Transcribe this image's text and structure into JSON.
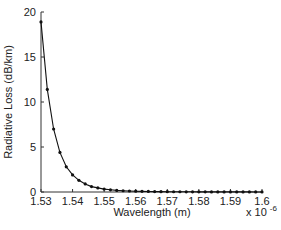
{
  "chart_data": {
    "type": "line",
    "title": "",
    "xlabel": "Wavelength (m)",
    "ylabel": "Radiative Loss (dB/km)",
    "x_multiplier": "x 10",
    "x_multiplier_exp": "-6",
    "xlim": [
      1.53,
      1.6
    ],
    "ylim": [
      0,
      20
    ],
    "xticks": [
      "1.53",
      "1.54",
      "1.55",
      "1.56",
      "1.57",
      "1.58",
      "1.59",
      "1.6"
    ],
    "yticks": [
      "0",
      "5",
      "10",
      "15",
      "20"
    ],
    "grid": false,
    "legend": null,
    "series": [
      {
        "name": "Radiative Loss",
        "marker": "dot",
        "color": "#111111",
        "x": [
          1.53,
          1.532,
          1.534,
          1.536,
          1.538,
          1.54,
          1.542,
          1.544,
          1.546,
          1.548,
          1.55,
          1.552,
          1.554,
          1.556,
          1.558,
          1.56,
          1.562,
          1.564,
          1.566,
          1.568,
          1.57,
          1.572,
          1.574,
          1.576,
          1.578,
          1.58,
          1.582,
          1.584,
          1.586,
          1.588,
          1.59,
          1.592,
          1.594,
          1.596,
          1.598,
          1.6
        ],
        "values": [
          18.9,
          11.4,
          7.0,
          4.4,
          2.8,
          1.9,
          1.3,
          0.9,
          0.6,
          0.45,
          0.32,
          0.24,
          0.18,
          0.14,
          0.11,
          0.09,
          0.07,
          0.06,
          0.05,
          0.04,
          0.035,
          0.03,
          0.025,
          0.02,
          0.018,
          0.016,
          0.014,
          0.012,
          0.01,
          0.009,
          0.008,
          0.007,
          0.006,
          0.006,
          0.005,
          0.005
        ]
      }
    ]
  }
}
